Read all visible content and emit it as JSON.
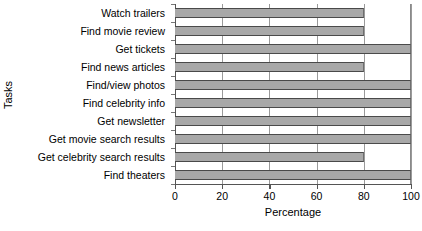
{
  "chart_data": {
    "type": "bar",
    "orientation": "horizontal",
    "title": "",
    "xlabel": "Percentage",
    "ylabel": "Tasks",
    "categories": [
      "Watch trailers",
      "Find movie review",
      "Get tickets",
      "Find news articles",
      "Find/view photos",
      "Find celebrity info",
      "Get newsletter",
      "Get movie search results",
      "Get celebrity search results",
      "Find theaters"
    ],
    "values": [
      80,
      80,
      100,
      80,
      100,
      100,
      100,
      100,
      80,
      100
    ],
    "xlim": [
      0,
      100
    ],
    "xticks": [
      0,
      20,
      40,
      60,
      80,
      100
    ],
    "xtick_labels": [
      "0",
      "20",
      "40",
      "60",
      "80",
      "100"
    ],
    "grid": true,
    "grid_axis": "x",
    "legend": null,
    "bar_color": "#a8a8a8",
    "bar_edge_color": "#4a4a4a",
    "axis_color": "#555555",
    "gridline_color": "#9a9a9a",
    "background_color": "#ffffff"
  }
}
